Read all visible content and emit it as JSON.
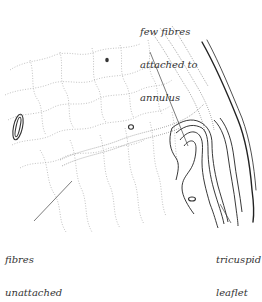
{
  "labels": {
    "top": {
      "line1": "few fibres",
      "line2": "attached to",
      "line3": "annulus"
    },
    "bottom_left": {
      "line1": "fibres",
      "line2": "unattached"
    },
    "bottom_right": {
      "line1": "tricuspid",
      "line2": "leaflet"
    }
  },
  "colors": {
    "ink": "#333333",
    "dots": "#9a9a9a",
    "background": "#ffffff"
  }
}
